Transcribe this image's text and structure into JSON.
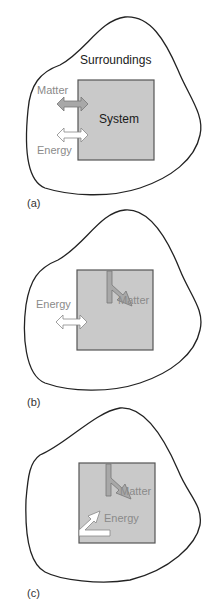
{
  "figure": {
    "panels": [
      {
        "id": "a",
        "caption": "(a)",
        "surroundings_label": "Surroundings",
        "system_label": "System",
        "arrows": [
          {
            "label": "Matter",
            "type": "double-arrow",
            "direction": "bidirectional",
            "fill": "#a8a8a8"
          },
          {
            "label": "Energy",
            "type": "double-arrow",
            "direction": "bidirectional",
            "fill": "#ffffff"
          }
        ]
      },
      {
        "id": "b",
        "caption": "(b)",
        "arrows": [
          {
            "label": "Matter",
            "type": "bent-arrow",
            "direction": "internal",
            "fill": "#a8a8a8"
          },
          {
            "label": "Energy",
            "type": "double-arrow",
            "direction": "bidirectional",
            "fill": "#ffffff"
          }
        ]
      },
      {
        "id": "c",
        "caption": "(c)",
        "arrows": [
          {
            "label": "Matter",
            "type": "bent-arrow",
            "direction": "internal",
            "fill": "#a8a8a8"
          },
          {
            "label": "Energy",
            "type": "bent-arrow",
            "direction": "internal",
            "fill": "#ffffff"
          }
        ]
      }
    ],
    "colors": {
      "system_fill": "#c9c9c9",
      "system_border": "#555555",
      "outline": "#222222",
      "label_gray": "#8a8a8a"
    }
  }
}
